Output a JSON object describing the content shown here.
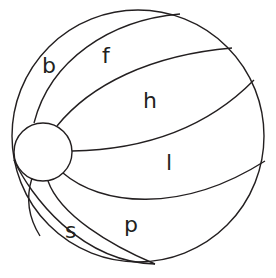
{
  "diagram": {
    "stroke_color": "#231f20",
    "background_color": "#ffffff",
    "labels": {
      "b": "b",
      "f": "f",
      "h": "h",
      "l": "l",
      "s": "s",
      "p": "p"
    }
  }
}
